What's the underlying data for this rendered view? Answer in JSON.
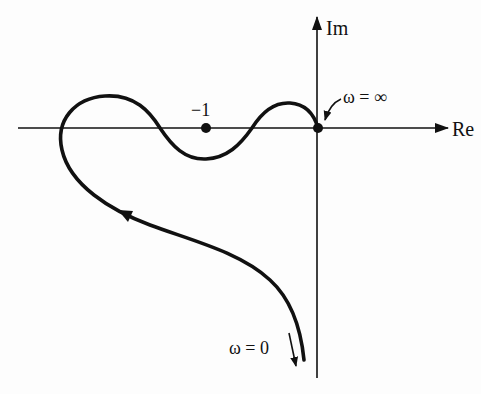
{
  "figure": {
    "type": "Nyquist plot",
    "axes": {
      "real_label": "Re",
      "imag_label": "Im"
    },
    "labels": {
      "critical_point": "−1",
      "omega_infinity": "ω = ∞",
      "omega_zero": "ω = 0"
    },
    "points": [
      {
        "name": "critical-point",
        "label": "−1",
        "re": -1,
        "im": 0
      },
      {
        "name": "origin",
        "label": "ω = ∞",
        "re": 0,
        "im": 0
      }
    ],
    "curve_description": "Nyquist locus starting at ω = 0 far in lower half-plane near the negative real side of the Im axis, sweeping up-left, looping around the left, crossing the real axis three times (left of −1, between −1 and 0 twice) and ending at the origin at ω = ∞",
    "colors": {
      "stroke": "#111111",
      "background": "#fdfdfd"
    }
  }
}
